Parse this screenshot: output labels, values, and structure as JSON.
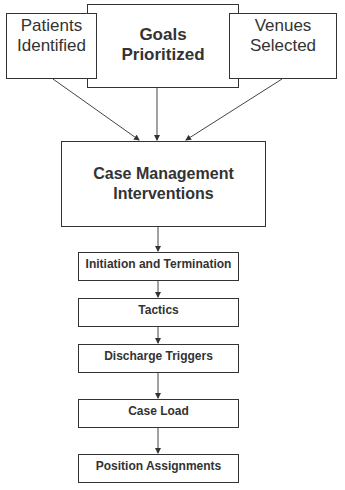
{
  "diagram": {
    "top_row": [
      {
        "id": "patients",
        "label": "Patients Identified",
        "lines": [
          "Patients",
          "Identified"
        ]
      },
      {
        "id": "goals",
        "label": "Goals Prioritized",
        "lines": [
          "Goals",
          "Prioritized"
        ]
      },
      {
        "id": "venues",
        "label": "Venues Selected",
        "lines": [
          "Venues",
          "Selected"
        ]
      }
    ],
    "central": {
      "label": "Case Management Interventions",
      "lines": [
        "Case Management",
        "Interventions"
      ]
    },
    "steps": [
      {
        "label": "Initiation and Termination"
      },
      {
        "label": "Tactics"
      },
      {
        "label": "Discharge Triggers"
      },
      {
        "label": "Case Load"
      },
      {
        "label": "Position Assignments"
      }
    ],
    "edges": [
      [
        "Patients Identified",
        "Case Management Interventions"
      ],
      [
        "Goals Prioritized",
        "Case Management Interventions"
      ],
      [
        "Venues Selected",
        "Case Management Interventions"
      ],
      [
        "Case Management Interventions",
        "Initiation and Termination"
      ],
      [
        "Initiation and Termination",
        "Tactics"
      ],
      [
        "Tactics",
        "Discharge Triggers"
      ],
      [
        "Discharge Triggers",
        "Case Load"
      ],
      [
        "Case Load",
        "Position Assignments"
      ]
    ],
    "colors": {
      "stroke": "#333333",
      "text": "#333333",
      "background": "#ffffff"
    }
  }
}
